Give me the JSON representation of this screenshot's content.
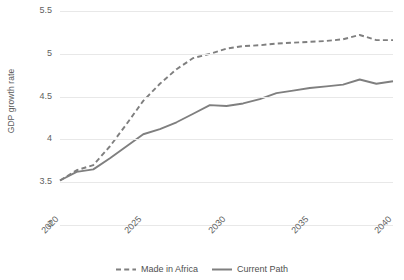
{
  "chart_data": {
    "type": "line",
    "title": "",
    "xlabel": "",
    "ylabel": "GDP growth rate",
    "xlim": [
      2020,
      2040
    ],
    "ylim": [
      3,
      5.5
    ],
    "yticks": [
      "3",
      "3.5",
      "4",
      "4.5",
      "5",
      "5.5"
    ],
    "ytick_values": [
      3,
      3.5,
      4,
      4.5,
      5,
      5.5
    ],
    "xticks": [
      "2020",
      "2025",
      "2030",
      "2035",
      "2040"
    ],
    "xtick_values": [
      2020,
      2025,
      2030,
      2035,
      2040
    ],
    "grid": "horizontal",
    "legend_position": "bottom",
    "x": [
      2020,
      2021,
      2022,
      2023,
      2024,
      2025,
      2026,
      2027,
      2028,
      2029,
      2030,
      2031,
      2032,
      2033,
      2034,
      2035,
      2036,
      2037,
      2038,
      2039,
      2040
    ],
    "series": [
      {
        "name": "Made in Africa",
        "style": "dashed",
        "color": "#7f7f7f",
        "values": [
          3.52,
          3.64,
          3.7,
          3.92,
          4.18,
          4.45,
          4.65,
          4.82,
          4.95,
          5.0,
          5.06,
          5.09,
          5.1,
          5.12,
          5.13,
          5.14,
          5.15,
          5.17,
          5.22,
          5.16,
          5.16
        ]
      },
      {
        "name": "Current Path",
        "style": "solid",
        "color": "#7f7f7f",
        "values": [
          3.52,
          3.62,
          3.65,
          3.78,
          3.92,
          4.06,
          4.12,
          4.2,
          4.3,
          4.4,
          4.39,
          4.42,
          4.47,
          4.54,
          4.57,
          4.6,
          4.62,
          4.64,
          4.7,
          4.65,
          4.68
        ]
      }
    ]
  },
  "legend": {
    "items": [
      {
        "label": "Made in Africa",
        "style": "dashed"
      },
      {
        "label": "Current Path",
        "style": "solid"
      }
    ]
  },
  "colors": {
    "line": "#7f7f7f",
    "grid": "#e8e8e8",
    "text": "#5f5f5f",
    "background": "#ffffff"
  }
}
